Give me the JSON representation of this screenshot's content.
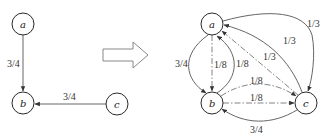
{
  "left_graph": {
    "nodes": [
      {
        "id": "a",
        "label": "a",
        "x": 23,
        "y": 24
      },
      {
        "id": "b",
        "label": "b",
        "x": 23,
        "y": 103
      },
      {
        "id": "c",
        "label": "c",
        "x": 117,
        "y": 104
      }
    ],
    "edges": [
      {
        "from": "a",
        "to": "b",
        "label": "3/4",
        "style": "solid"
      },
      {
        "from": "c",
        "to": "b",
        "label": "3/4",
        "style": "solid"
      }
    ]
  },
  "transform_arrow": {
    "direction": "right",
    "style": "hollow"
  },
  "right_graph": {
    "nodes": [
      {
        "id": "a",
        "label": "a",
        "x": 212,
        "y": 24
      },
      {
        "id": "b",
        "label": "b",
        "x": 212,
        "y": 103
      },
      {
        "id": "c",
        "label": "c",
        "x": 306,
        "y": 103
      }
    ],
    "edges": [
      {
        "from": "a",
        "to": "b",
        "label": "3/4",
        "style": "solid"
      },
      {
        "from": "a",
        "to": "b",
        "label": "1/8",
        "style": "dash-dot"
      },
      {
        "from": "b",
        "to": "a",
        "label": "1/8",
        "style": "solid"
      },
      {
        "from": "a",
        "to": "c",
        "label": "1/3",
        "style": "solid"
      },
      {
        "from": "c",
        "to": "a",
        "label": "1/3",
        "style": "solid"
      },
      {
        "from": "c",
        "to": "a",
        "label": "1/3",
        "style": "dash-dot"
      },
      {
        "from": "b",
        "to": "c",
        "label": "1/8",
        "style": "dash-dot"
      },
      {
        "from": "b",
        "to": "c",
        "label": "1/8",
        "style": "dash-dot"
      },
      {
        "from": "c",
        "to": "b",
        "label": "3/4",
        "style": "solid"
      }
    ]
  },
  "labels": {
    "left_ab": "3/4",
    "left_cb": "3/4",
    "right_ab_curve": "3/4",
    "right_ab_straight": "1/8",
    "right_ba_curve": "1/8",
    "right_ac_outer": "1/3",
    "right_ca_mid": "1/3",
    "right_ca_straight": "1/3",
    "right_bc_curve": "1/8",
    "right_bc_straight": "1/8",
    "right_cb_bottom": "3/4",
    "node_a": "a",
    "node_b": "b",
    "node_c": "c"
  }
}
